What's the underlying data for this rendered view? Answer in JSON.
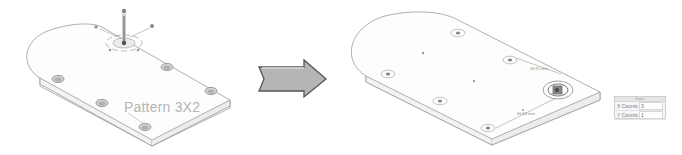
{
  "figure": {
    "left_panel": {
      "annotation": "Pattern 3X2",
      "description": "Plate with a single counterbored hole and move/rotate manipulator, five countersunk features shown"
    },
    "arrow": {
      "direction": "right",
      "fill_color": "#b5b5b5",
      "stroke_color": "#555555"
    },
    "right_panel": {
      "dimensions": [
        {
          "id": "dim-upper",
          "label": "46.91 mm"
        },
        {
          "id": "dim-lower",
          "label": "66.63 mm"
        }
      ]
    },
    "pattern_dialog": {
      "title": "Pattern",
      "rows": [
        {
          "label": "X Counts:",
          "value": "3"
        },
        {
          "label": "Y Counts:",
          "value": "1"
        }
      ]
    },
    "colors": {
      "line": "#9a9a9a",
      "hole_fill": "#d9d9d9",
      "hole_dark": "#8c8c8c",
      "background": "#ffffff"
    }
  }
}
